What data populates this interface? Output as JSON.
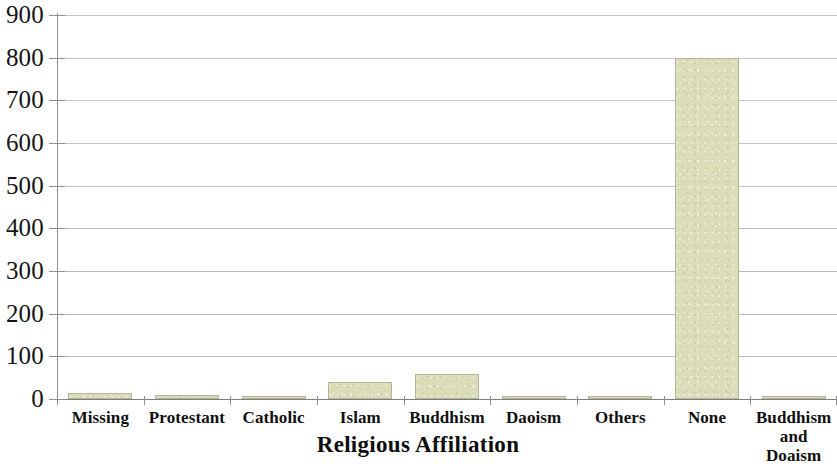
{
  "chart_data": {
    "type": "bar",
    "title": "",
    "xlabel": "Religious Affiliation",
    "ylabel": "",
    "categories": [
      "Missing",
      "Protestant",
      "Catholic",
      "Islam",
      "Buddhism",
      "Daoism",
      "Others",
      "None",
      "Buddhism and Doaism"
    ],
    "values": [
      14,
      9,
      4,
      40,
      58,
      7,
      8,
      800,
      5
    ],
    "ylim": [
      0,
      900
    ],
    "yticks": [
      0,
      100,
      200,
      300,
      400,
      500,
      600,
      700,
      800,
      900
    ],
    "ytick_labels": [
      "0",
      "100",
      "200",
      "300",
      "400",
      "500",
      "600",
      "700",
      "800",
      "900"
    ],
    "grid": true,
    "legend": false,
    "bar_color": "#dcdcb8",
    "bar_border_color": "#b5b59a",
    "gridline_color": "#b9b9b9",
    "axis_color": "#8d8d8d",
    "text_color": "#101010"
  },
  "axis": {
    "x_title": "Religious Affiliation",
    "category_lines": [
      [
        "Missing"
      ],
      [
        "Protestant"
      ],
      [
        "Catholic"
      ],
      [
        "Islam"
      ],
      [
        "Buddhism"
      ],
      [
        "Daoism"
      ],
      [
        "Others"
      ],
      [
        "None"
      ],
      [
        "Buddhism",
        "and",
        "Doaism"
      ]
    ]
  }
}
